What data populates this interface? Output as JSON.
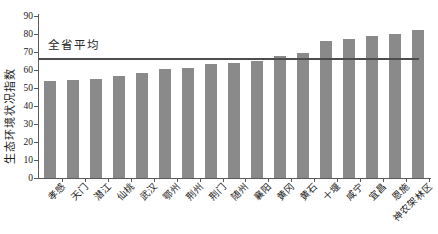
{
  "chart_data": {
    "type": "bar",
    "title": "",
    "xlabel": "",
    "ylabel": "生态环境状况指数",
    "ylim": [
      0,
      90
    ],
    "ytick_step": 10,
    "grid": false,
    "legend": null,
    "categories": [
      "孝感",
      "天门",
      "潜江",
      "仙桃",
      "武汉",
      "鄂州",
      "荆州",
      "荆门",
      "随州",
      "襄阳",
      "黄冈",
      "黄石",
      "十堰",
      "咸宁",
      "宜昌",
      "恩施",
      "神农架林区"
    ],
    "values": [
      54,
      54.5,
      55,
      56.5,
      58.5,
      60.5,
      61,
      63.5,
      64,
      65,
      68,
      69.5,
      76,
      77.5,
      79,
      80,
      82.5
    ],
    "average_line": {
      "label": "全省平均",
      "value": 66
    },
    "colors": {
      "bar": "#8a8a8a",
      "average_line": "#4d4d4d",
      "axis": "#595959",
      "text": "#1a1a1a"
    }
  }
}
